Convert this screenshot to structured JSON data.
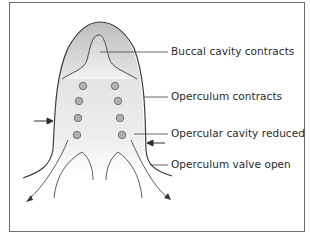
{
  "figure": {
    "labels": [
      {
        "id": "buccal",
        "text": "Buccal cavity contracts"
      },
      {
        "id": "operculum",
        "text": "Operculum contracts"
      },
      {
        "id": "opercular-cavity",
        "text": "Opercular cavity reduced"
      },
      {
        "id": "valve",
        "text": "Operculum valve open"
      }
    ],
    "colors": {
      "outline": "#3a3a3a",
      "fill_dark": "#c8c8c8",
      "fill_light": "#f2f2f2",
      "dot_fill": "#b0b0b0",
      "dot_stroke": "#6a6a6a",
      "leader": "#555555",
      "border": "#6e6e6e"
    }
  }
}
